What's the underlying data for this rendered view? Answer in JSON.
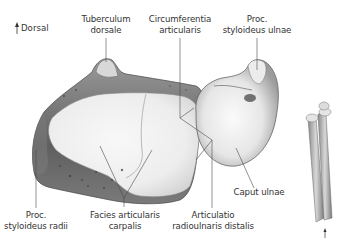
{
  "figure": {
    "orientation": {
      "arrow_icon": "arrow-up-icon",
      "label": "Dorsal"
    },
    "labels": {
      "tuberculum_dorsale": {
        "line1": "Tuberculum",
        "line2": "dorsale"
      },
      "circumferentia_articularis": {
        "line1": "Circumferentia",
        "line2": "articularis"
      },
      "proc_styloideus_ulnae": {
        "line1": "Proc.",
        "line2": "styloideus ulnae"
      },
      "caput_ulnae": {
        "line1": "Caput ulnae"
      },
      "proc_styloideus_radii": {
        "line1": "Proc.",
        "line2": "styloideus radii"
      },
      "facies_articularis_carpalis": {
        "line1": "Facies articularis",
        "line2": "carpalis"
      },
      "articulatio_radioulnaris_distalis": {
        "line1": "Articulatio",
        "line2": "radioulnaris distalis"
      }
    },
    "thumbnail": {
      "description": "forearm bones orientation thumbnail",
      "arrow_icon": "arrow-up-icon"
    },
    "colors": {
      "bone_light": "#f4f4f4",
      "bone_mid": "#cfcfcf",
      "bone_dark": "#6e6e6e",
      "leader_line": "#4a4a4a",
      "text": "#333333"
    }
  }
}
